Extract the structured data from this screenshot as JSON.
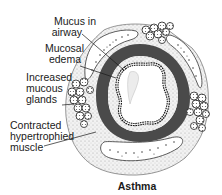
{
  "diagram": {
    "title": "Asthma",
    "labels": [
      {
        "id": "mucus",
        "line1": "Mucus in",
        "line2": "airway"
      },
      {
        "id": "edema",
        "line1": "Mucosal",
        "line2": "edema"
      },
      {
        "id": "glands",
        "line1": "Increased",
        "line2": "mucous",
        "line3": "glands"
      },
      {
        "id": "muscle",
        "line1": "Contracted",
        "line2": "hypertrophied",
        "line3": "muscle"
      }
    ],
    "colors": {
      "ink": "#1a1a1a",
      "muscle": "#4a4a4a",
      "stipple": "#d9d9d9",
      "background": "#ffffff"
    }
  }
}
